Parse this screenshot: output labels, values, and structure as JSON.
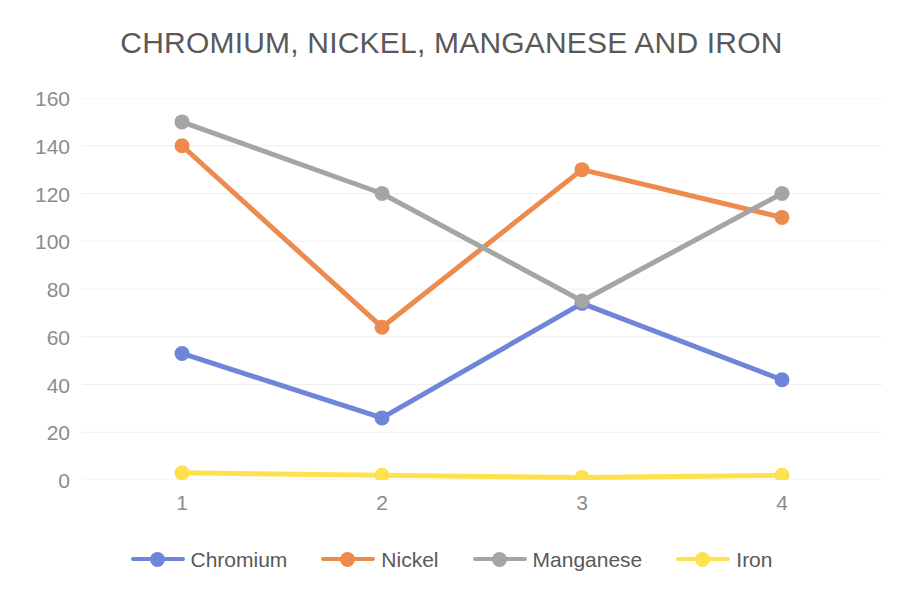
{
  "chart_data": {
    "type": "line",
    "title": "CHROMIUM, NICKEL, MANGANESE AND IRON",
    "xlabel": "",
    "ylabel": "",
    "x": [
      1,
      2,
      3,
      4
    ],
    "categories": [
      "1",
      "2",
      "3",
      "4"
    ],
    "xtick_labels": [
      "1",
      "2",
      "3",
      "4"
    ],
    "ytick_labels": [
      "160",
      "140",
      "120",
      "100",
      "80",
      "60",
      "40",
      "20",
      "0"
    ],
    "yticks": [
      160,
      140,
      120,
      100,
      80,
      60,
      40,
      20,
      0
    ],
    "ylim": [
      0,
      160
    ],
    "grid": "horizontal",
    "legend_position": "bottom",
    "series": [
      {
        "name": "Chromium",
        "color": "#6F85D9",
        "values": [
          53,
          26,
          74,
          42
        ]
      },
      {
        "name": "Nickel",
        "color": "#ED8A4E",
        "values": [
          140,
          64,
          130,
          110
        ]
      },
      {
        "name": "Manganese",
        "color": "#A5A5A5",
        "values": [
          150,
          120,
          75,
          120
        ]
      },
      {
        "name": "Iron",
        "color": "#FFE14D",
        "values": [
          3,
          2,
          1,
          2
        ]
      }
    ]
  },
  "style": {
    "title_color": "#595959",
    "tick_color": "#8C8C8C",
    "gridline_color": "#EFEFEF",
    "background": "#FFFFFF"
  }
}
